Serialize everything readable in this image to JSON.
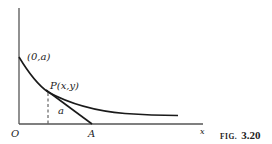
{
  "figure": {
    "caption_word": "FIG.",
    "caption_number": "3.20",
    "labels": {
      "y_intercept": "(0,a)",
      "point": "P(x,y)",
      "segment": "a",
      "origin": "O",
      "tangent_x_intercept": "A",
      "x_axis": "x"
    },
    "colors": {
      "stroke": "#1a1a1a",
      "axis": "#555555",
      "background": "#ffffff"
    }
  }
}
